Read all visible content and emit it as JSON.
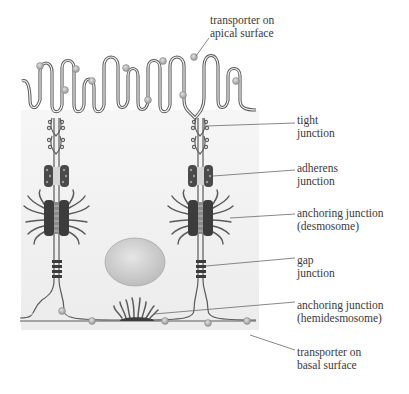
{
  "figure": {
    "colors": {
      "cytoplasm": "#f1f1f1",
      "membrane": "#5a5a5a",
      "transporter": "#b4b4b4",
      "nucleus": "#cfcfcf",
      "junction_dark": "#3c3c3c",
      "leader_line": "#6a6a6a"
    },
    "labels": [
      {
        "id": "apical-transporter",
        "lines": [
          "transporter on",
          "apical surface"
        ]
      },
      {
        "id": "tight-junction",
        "lines": [
          "tight",
          "junction"
        ]
      },
      {
        "id": "adherens-junction",
        "lines": [
          "adherens",
          "junction"
        ]
      },
      {
        "id": "desmosome",
        "lines": [
          "anchoring junction",
          "(desmosome)"
        ]
      },
      {
        "id": "gap-junction",
        "lines": [
          "gap",
          "junction"
        ]
      },
      {
        "id": "hemidesmosome",
        "lines": [
          "anchoring junction",
          "(hemidesmosome)"
        ]
      },
      {
        "id": "basal-transporter",
        "lines": [
          "transporter on",
          "basal surface"
        ]
      }
    ]
  }
}
